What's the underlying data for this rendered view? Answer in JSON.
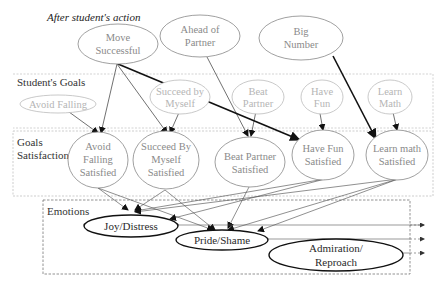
{
  "title": "After student's action",
  "sections": {
    "goals": "Student's Goals",
    "satisfaction": "Goals Satisfaction",
    "emotions": "Emotions"
  },
  "action_nodes": [
    {
      "id": "move",
      "lines": [
        "Move",
        "Successful"
      ]
    },
    {
      "id": "ahead",
      "lines": [
        "Ahead of",
        "Partner"
      ]
    },
    {
      "id": "big",
      "lines": [
        "Big",
        "Number"
      ]
    }
  ],
  "goal_nodes": [
    {
      "id": "avoid",
      "lines": [
        "Avoid Falling"
      ]
    },
    {
      "id": "succeed",
      "lines": [
        "Succeed by",
        "Myself"
      ]
    },
    {
      "id": "beat",
      "lines": [
        "Beat",
        "Partner"
      ]
    },
    {
      "id": "fun",
      "lines": [
        "Have",
        "Fun"
      ]
    },
    {
      "id": "learn",
      "lines": [
        "Learn",
        "Math"
      ]
    }
  ],
  "satisfaction_nodes": [
    {
      "id": "avoid_s",
      "lines": [
        "Avoid",
        "Falling",
        "Satisfied"
      ]
    },
    {
      "id": "succeed_s",
      "lines": [
        "Succeed By",
        "Myself",
        "Satisfied"
      ]
    },
    {
      "id": "beat_s",
      "lines": [
        "Beat Partner",
        "Satisfied"
      ]
    },
    {
      "id": "fun_s",
      "lines": [
        "Have Fun",
        "Satisfied"
      ]
    },
    {
      "id": "learn_s",
      "lines": [
        "Learn math",
        "Satisfied"
      ]
    }
  ],
  "emotion_nodes": [
    {
      "id": "joy",
      "lines": [
        "Joy/Distress"
      ]
    },
    {
      "id": "pride",
      "lines": [
        "Pride/Shame"
      ]
    },
    {
      "id": "admiration",
      "lines": [
        "Admiration/",
        "Reproach"
      ]
    }
  ],
  "colors": {
    "light_node": "#9a9a9a",
    "dark_node": "#1a1a1a",
    "box": "#b0b0b0",
    "edge": "#333333"
  }
}
